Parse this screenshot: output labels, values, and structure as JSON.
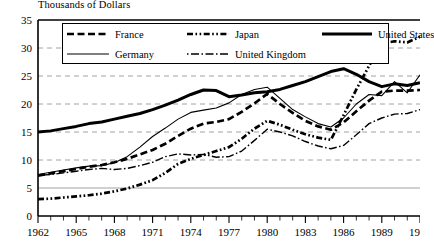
{
  "chart_title": "Thousands of Dollars",
  "legend": {
    "entries": [
      {
        "label": "France",
        "style": "dashed",
        "key": "france-key"
      },
      {
        "label": "Japan",
        "style": "dash-dot-dot",
        "key": "japan-key"
      },
      {
        "label": "United States",
        "style": "thick-solid",
        "key": "united-states-key"
      },
      {
        "label": "Germany",
        "style": "thin-solid",
        "key": "germany-key"
      },
      {
        "label": "United Kingdom",
        "style": "dash-dot",
        "key": "united-kingdom-key"
      }
    ]
  },
  "axes": {
    "y_ticks": [
      "0",
      "5",
      "10",
      "15",
      "20",
      "25",
      "30",
      "35"
    ],
    "x_ticks": [
      "1962",
      "1965",
      "1968",
      "1971",
      "1974",
      "1977",
      "1980",
      "1983",
      "1986",
      "1989",
      "1992"
    ]
  },
  "chart_data": {
    "type": "line",
    "title": "Thousands of Dollars",
    "xlabel": "",
    "ylabel": "Thousands of Dollars",
    "xlim": [
      1962,
      1992
    ],
    "ylim": [
      0,
      35
    ],
    "ytick_step": 5,
    "grid": "horizontal-dashed",
    "legend_position": "top-inside",
    "x": [
      1962,
      1963,
      1964,
      1965,
      1966,
      1967,
      1968,
      1969,
      1970,
      1971,
      1972,
      1973,
      1974,
      1975,
      1976,
      1977,
      1978,
      1979,
      1980,
      1981,
      1982,
      1983,
      1984,
      1985,
      1986,
      1987,
      1988,
      1989,
      1990,
      1991,
      1992
    ],
    "series": [
      {
        "name": "United States",
        "style": "thick-solid",
        "values": [
          15.0,
          15.2,
          15.6,
          16.0,
          16.5,
          16.8,
          17.3,
          17.8,
          18.3,
          19.0,
          19.8,
          20.7,
          21.7,
          22.5,
          22.4,
          21.3,
          21.6,
          22.0,
          22.2,
          22.6,
          23.3,
          24.0,
          24.9,
          25.8,
          26.3,
          25.3,
          24.0,
          23.1,
          23.6,
          23.3,
          23.8
        ]
      },
      {
        "name": "Germany",
        "style": "thin-solid",
        "values": [
          7.4,
          7.8,
          8.2,
          8.6,
          8.9,
          9.0,
          9.5,
          10.6,
          12.3,
          14.2,
          15.7,
          17.3,
          18.5,
          18.9,
          19.3,
          20.2,
          21.7,
          22.6,
          23.0,
          21.0,
          19.0,
          17.7,
          16.5,
          15.9,
          17.5,
          20.0,
          21.7,
          21.5,
          24.0,
          22.0,
          25.2
        ]
      },
      {
        "name": "France",
        "style": "dashed",
        "values": [
          7.2,
          7.6,
          8.0,
          8.4,
          8.8,
          9.1,
          9.6,
          10.2,
          11.0,
          11.8,
          12.9,
          14.3,
          15.6,
          16.5,
          16.8,
          17.3,
          18.6,
          20.1,
          21.8,
          20.0,
          18.4,
          17.0,
          16.0,
          15.4,
          16.7,
          18.7,
          20.6,
          22.2,
          22.4,
          22.4,
          22.5
        ]
      },
      {
        "name": "United Kingdom",
        "style": "dash-dot",
        "values": [
          7.3,
          7.4,
          7.7,
          8.0,
          8.3,
          8.5,
          8.3,
          8.5,
          9.0,
          9.6,
          10.6,
          11.1,
          10.9,
          11.0,
          10.5,
          10.6,
          11.6,
          13.5,
          15.5,
          15.0,
          14.3,
          13.3,
          12.5,
          12.0,
          12.6,
          14.5,
          16.5,
          17.5,
          18.2,
          18.3,
          19.0
        ]
      },
      {
        "name": "Japan",
        "style": "dash-dot-dot",
        "values": [
          3.0,
          3.1,
          3.3,
          3.5,
          3.7,
          4.0,
          4.4,
          4.9,
          5.6,
          6.4,
          7.7,
          9.3,
          10.2,
          10.9,
          11.6,
          12.3,
          13.8,
          15.6,
          17.0,
          16.3,
          15.4,
          14.6,
          14.0,
          13.6,
          18.0,
          22.6,
          26.8,
          30.8,
          31.2,
          31.0,
          32.0
        ]
      }
    ]
  }
}
